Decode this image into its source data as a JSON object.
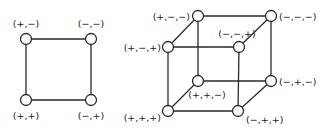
{
  "square": {
    "nodes": [
      {
        "id": "pm",
        "label": "(+,−)",
        "x": 26,
        "y": 39
      },
      {
        "id": "mm",
        "label": "(−,−)",
        "x": 91,
        "y": 39
      },
      {
        "id": "pp",
        "label": "(+,+)",
        "x": 26,
        "y": 100
      },
      {
        "id": "mp",
        "label": "(−,+)",
        "x": 91,
        "y": 100
      }
    ],
    "edges": [
      [
        "pm",
        "mm"
      ],
      [
        "pm",
        "pp"
      ],
      [
        "mm",
        "mp"
      ],
      [
        "pp",
        "mp"
      ]
    ]
  },
  "cube": {
    "nodes": [
      {
        "id": "pmm",
        "label": "(+,−,−)",
        "x": 198,
        "y": 16
      },
      {
        "id": "mmm",
        "label": "(−,−,−)",
        "x": 271,
        "y": 16
      },
      {
        "id": "pmp",
        "label": "(+,−,+)",
        "x": 168,
        "y": 47
      },
      {
        "id": "mmp",
        "label": "(−,−,+)",
        "x": 239,
        "y": 47
      },
      {
        "id": "ppm",
        "label": "(+,+,−)",
        "x": 198,
        "y": 81
      },
      {
        "id": "mpm",
        "label": "(−,+,−)",
        "x": 271,
        "y": 81
      },
      {
        "id": "ppp",
        "label": "(+,+,+)",
        "x": 168,
        "y": 111
      },
      {
        "id": "mpp",
        "label": "(−,+,+)",
        "x": 238,
        "y": 111
      }
    ],
    "edges": [
      [
        "pmm",
        "mmm"
      ],
      [
        "pmm",
        "pmp"
      ],
      [
        "pmm",
        "ppm"
      ],
      [
        "mmm",
        "mmp"
      ],
      [
        "mmm",
        "mpm"
      ],
      [
        "pmp",
        "mmp"
      ],
      [
        "pmp",
        "ppp"
      ],
      [
        "mmp",
        "mpp"
      ],
      [
        "ppm",
        "mpm"
      ],
      [
        "ppm",
        "ppp"
      ],
      [
        "mpm",
        "mpp"
      ],
      [
        "ppp",
        "mpp"
      ]
    ]
  }
}
